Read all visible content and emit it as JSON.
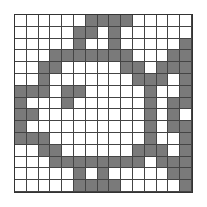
{
  "puzzle": {
    "rows": 15,
    "cols": 15,
    "filled_color": "#7a7a7a",
    "empty_color": "#ffffff",
    "grid": [
      "000000111100000",
      "000001101000000",
      "000001001000001",
      "000111111100011",
      "001100000110111",
      "001000000011101",
      "111011000001001",
      "100010000001011",
      "110000000001010",
      "100000000001011",
      "111000000001001",
      "001100000011101",
      "000111111110111",
      "000001010000011",
      "000001111000001"
    ]
  }
}
